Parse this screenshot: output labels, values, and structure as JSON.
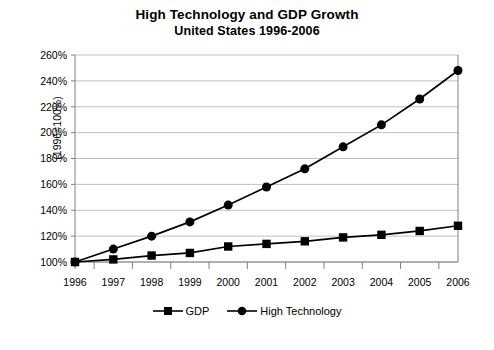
{
  "chart_data": {
    "type": "line",
    "title": "High Technology and GDP Growth",
    "subtitle": "United States 1996-2006",
    "xlabel": "",
    "ylabel": "(1996=100%)",
    "categories": [
      "1996",
      "1997",
      "1998",
      "1999",
      "2000",
      "2001",
      "2002",
      "2003",
      "2004",
      "2005",
      "2006"
    ],
    "series": [
      {
        "name": "GDP",
        "marker": "square",
        "values": [
          100,
          102,
          105,
          107,
          112,
          114,
          116,
          119,
          121,
          124,
          128
        ]
      },
      {
        "name": "High Technology",
        "marker": "circle",
        "values": [
          100,
          110,
          120,
          131,
          144,
          158,
          172,
          189,
          206,
          226,
          248
        ]
      }
    ],
    "ylim": [
      100,
      260
    ],
    "ytick_step": 20,
    "ytick_labels": [
      "100%",
      "120%",
      "140%",
      "160%",
      "180%",
      "200%",
      "220%",
      "240%",
      "260%"
    ],
    "grid": "horizontal",
    "legend_position": "bottom",
    "colors": {
      "series_line": "#000000",
      "grid": "#c0c0c0",
      "axis": "#808080",
      "background": "#ffffff"
    }
  },
  "legend": {
    "items": [
      {
        "label": "GDP",
        "marker": "square"
      },
      {
        "label": "High Technology",
        "marker": "circle"
      }
    ]
  }
}
